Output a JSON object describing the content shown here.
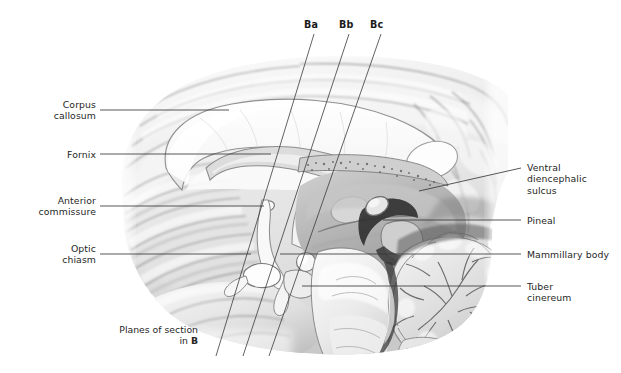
{
  "figure": {
    "background_color": "#ffffff",
    "text_color": "#262626",
    "leader_color": "#3a3a3a"
  },
  "labels_left": [
    {
      "name": "corpus-callosum",
      "text": "Corpus\ncallosum",
      "x": 28,
      "y": 99,
      "w": 68,
      "leader": {
        "x1": 100,
        "y1": 110,
        "x2": 229,
        "y2": 110
      }
    },
    {
      "name": "fornix",
      "text": "Fornix",
      "x": 28,
      "y": 149,
      "w": 68,
      "leader": {
        "x1": 100,
        "y1": 154,
        "x2": 271,
        "y2": 154
      }
    },
    {
      "name": "anterior-commissure",
      "text": "Anterior\ncommissure",
      "x": 14,
      "y": 195,
      "w": 82,
      "leader": {
        "x1": 100,
        "y1": 206,
        "x2": 264,
        "y2": 206
      }
    },
    {
      "name": "optic-chiasm",
      "text": "Optic\nchiasm",
      "x": 28,
      "y": 243,
      "w": 68,
      "leader": {
        "x1": 100,
        "y1": 254,
        "x2": 251,
        "y2": 254
      }
    }
  ],
  "labels_right": [
    {
      "name": "ventral-diencephalic-sulcus",
      "text": "Ventral\ndiencephalic\nsulcus",
      "x": 527,
      "y": 162,
      "w": 90,
      "leader": {
        "x1": 521,
        "y1": 168,
        "x2": 419,
        "y2": 191
      }
    },
    {
      "name": "pineal",
      "text": "Pineal",
      "x": 527,
      "y": 215,
      "w": 90,
      "leader": {
        "x1": 521,
        "y1": 220,
        "x2": 383,
        "y2": 220
      }
    },
    {
      "name": "mammillary-body",
      "text": "Mammillary body",
      "x": 527,
      "y": 249,
      "w": 94,
      "leader": {
        "x1": 521,
        "y1": 254,
        "x2": 280,
        "y2": 254
      }
    },
    {
      "name": "tuber-cinereum",
      "text": "Tuber\ncinereum",
      "x": 527,
      "y": 281,
      "w": 90,
      "leader": {
        "x1": 521,
        "y1": 286,
        "x2": 302,
        "y2": 286
      }
    }
  ],
  "section_planes": [
    {
      "name": "plane-ba",
      "label": "Ba",
      "label_x": 304,
      "label_y": 19,
      "x1": 314,
      "y1": 34,
      "x2": 216,
      "y2": 356
    },
    {
      "name": "plane-bb",
      "label": "Bb",
      "label_x": 339,
      "label_y": 19,
      "x1": 349,
      "y1": 34,
      "x2": 243,
      "y2": 356
    },
    {
      "name": "plane-bc",
      "label": "Bc",
      "label_x": 370,
      "label_y": 19,
      "x1": 381,
      "y1": 34,
      "x2": 269,
      "y2": 356
    }
  ],
  "caption": {
    "name": "planes-of-section-caption",
    "line1": "Planes of section",
    "line2_prefix": "in ",
    "line2_bold": "B",
    "x": 104,
    "y": 324,
    "w": 94
  }
}
